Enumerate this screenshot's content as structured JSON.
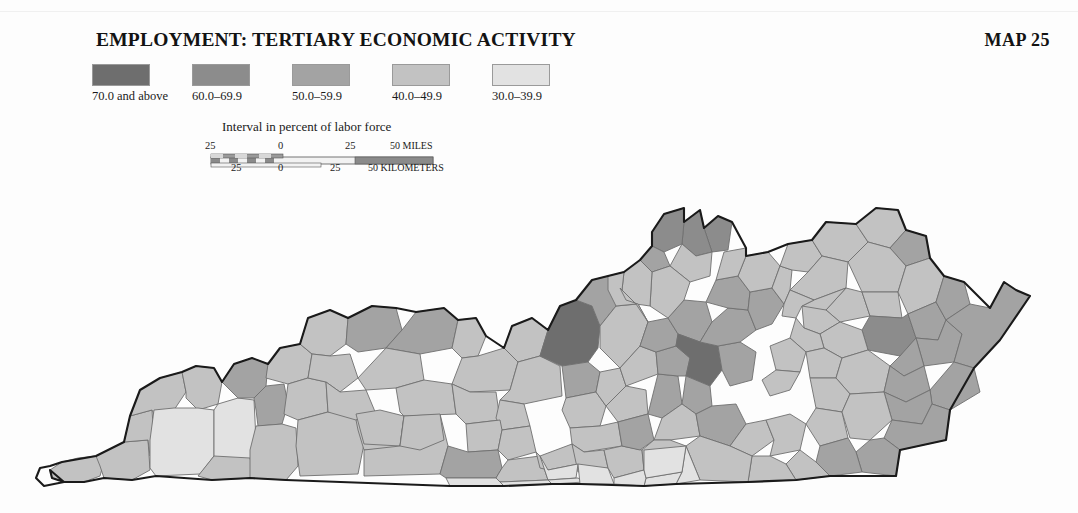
{
  "page": {
    "background": "#fdfdfd",
    "width": 1078,
    "height": 513
  },
  "header": {
    "title": "EMPLOYMENT: TERTIARY ECONOMIC ACTIVITY",
    "map_number": "MAP 25"
  },
  "legend": {
    "caption": "Interval in percent of labor force",
    "items": [
      {
        "label": "70.0 and above",
        "color": "#6e6e6e",
        "x": 18
      },
      {
        "label": "60.0–69.9",
        "color": "#8c8c8c",
        "x": 118
      },
      {
        "label": "50.0–59.9",
        "color": "#a3a3a3",
        "x": 218
      },
      {
        "label": "40.0–49.9",
        "color": "#c2c2c2",
        "x": 318
      },
      {
        "label": "30.0–39.9",
        "color": "#e2e2e2",
        "x": 418
      }
    ]
  },
  "scalebar": {
    "miles_unit": "50 MILES",
    "kilometers_unit": "50 KILOMETERS",
    "miles_ticks": [
      "25",
      "0",
      "25"
    ],
    "kilometers_ticks": [
      "25",
      "0",
      "25"
    ],
    "dark_color": "#8a8a8a",
    "light_color": "#f2f2f2",
    "border_color": "#555555"
  },
  "map": {
    "name": "kentucky-counties-choropleth",
    "outline_color": "#1a1a1a",
    "county_border_color": "#6f6f6f",
    "classes": {
      "c1": "#6e6e6e",
      "c2": "#8c8c8c",
      "c3": "#a3a3a3",
      "c4": "#c2c2c2",
      "c5": "#e2e2e2"
    },
    "counties": [
      {
        "id": "fulton",
        "class": "c4",
        "points": "50,470 62,462 78,458 96,456 104,462 100,476 84,482 64,482 52,478"
      },
      {
        "id": "hickman",
        "class": "c4",
        "points": "96,456 124,442 148,440 150,470 132,480 104,478 100,466"
      },
      {
        "id": "carlisle",
        "class": "c4",
        "points": "124,442 130,416 152,410 154,440 150,456 148,440"
      },
      {
        "id": "ballard",
        "class": "c4",
        "points": "130,416 140,390 160,378 182,372 186,392 174,410 154,414 152,410"
      },
      {
        "id": "mccracken",
        "class": "c4",
        "points": "182,372 196,366 214,368 222,382 218,404 198,410 186,398 186,392"
      },
      {
        "id": "graves",
        "class": "c5",
        "points": "150,440 154,410 174,408 198,408 214,410 214,456 200,474 156,476 150,468"
      },
      {
        "id": "marshall",
        "class": "c5",
        "points": "214,410 218,404 238,398 254,400 256,440 250,462 214,460"
      },
      {
        "id": "calloway",
        "class": "c4",
        "points": "214,456 250,458 254,478 212,480 198,476"
      },
      {
        "id": "livingston",
        "class": "c3",
        "points": "222,382 234,364 252,358 268,364 266,386 254,398 238,398"
      },
      {
        "id": "lyon",
        "class": "c3",
        "points": "254,398 266,386 284,384 288,404 282,424 258,426 256,410"
      },
      {
        "id": "trigg",
        "class": "c4",
        "points": "256,426 282,424 296,428 298,466 286,480 250,478 250,450"
      },
      {
        "id": "crittenden",
        "class": "c4",
        "points": "268,364 280,348 300,344 312,354 308,378 288,384 266,378"
      },
      {
        "id": "caldwell",
        "class": "c4",
        "points": "288,384 308,378 326,382 328,412 298,420 284,414"
      },
      {
        "id": "christian",
        "class": "c4",
        "points": "298,420 328,412 356,414 364,444 358,474 300,476 296,446"
      },
      {
        "id": "union",
        "class": "c4",
        "points": "300,344 308,318 330,310 348,318 346,344 330,356 312,354"
      },
      {
        "id": "webster",
        "class": "c4",
        "points": "312,354 330,356 350,354 358,378 340,392 326,382 308,378"
      },
      {
        "id": "hopkins",
        "class": "c4",
        "points": "326,382 340,392 366,390 376,414 356,420 328,412"
      },
      {
        "id": "muhlenberg",
        "class": "c4",
        "points": "356,420 376,414 396,418 400,448 364,450 358,430"
      },
      {
        "id": "todd",
        "class": "c4",
        "points": "356,414 364,444 400,446 404,416 380,410"
      },
      {
        "id": "logan",
        "class": "c4",
        "points": "400,446 404,416 440,414 448,446 440,474 364,476 364,450"
      },
      {
        "id": "henderson",
        "class": "c3",
        "points": "348,318 372,306 396,308 402,330 386,348 358,352 346,344"
      },
      {
        "id": "daviess",
        "class": "c3",
        "points": "402,330 416,312 444,308 458,320 452,348 420,354 386,348"
      },
      {
        "id": "mclean",
        "class": "c4",
        "points": "386,348 420,354 424,380 396,388 366,390 358,378"
      },
      {
        "id": "ohio",
        "class": "c4",
        "points": "396,388 424,380 452,384 456,414 404,416 400,412"
      },
      {
        "id": "butler",
        "class": "c4",
        "points": "400,446 404,416 440,414 444,440 420,450"
      },
      {
        "id": "hancock",
        "class": "c4",
        "points": "452,348 458,320 476,318 486,336 478,356 462,358"
      },
      {
        "id": "breckinridge",
        "class": "c4",
        "points": "462,358 478,356 504,348 518,362 510,390 470,392 452,384"
      },
      {
        "id": "grayson",
        "class": "c4",
        "points": "456,414 452,384 470,392 496,392 500,420 466,424"
      },
      {
        "id": "meade",
        "class": "c4",
        "points": "504,348 512,326 532,318 548,330 540,356 518,362"
      },
      {
        "id": "hardin",
        "class": "c4",
        "points": "510,390 518,362 540,356 560,366 562,396 524,404 500,400"
      },
      {
        "id": "larue",
        "class": "c4",
        "points": "500,400 524,404 530,426 502,430 496,418"
      },
      {
        "id": "edmonson",
        "class": "c4",
        "points": "466,424 500,420 502,430 498,450 468,452"
      },
      {
        "id": "warren",
        "class": "c3",
        "points": "440,474 448,446 468,452 498,450 502,468 496,478 446,478"
      },
      {
        "id": "hart",
        "class": "c4",
        "points": "498,450 502,430 530,426 536,452 508,460"
      },
      {
        "id": "barren",
        "class": "c4",
        "points": "496,478 502,468 508,460 540,456 548,480 500,482"
      },
      {
        "id": "jefferson",
        "class": "c1",
        "points": "548,330 560,306 576,300 592,306 600,326 598,348 588,362 562,366 540,356"
      },
      {
        "id": "oldham",
        "class": "c3",
        "points": "576,300 592,280 608,276 620,288 616,306 600,326 592,306"
      },
      {
        "id": "bullitt",
        "class": "c3",
        "points": "562,366 588,362 600,372 596,392 566,398"
      },
      {
        "id": "nelson",
        "class": "c4",
        "points": "566,398 596,392 606,406 600,426 570,428 562,410"
      },
      {
        "id": "spencer",
        "class": "c4",
        "points": "596,392 600,372 620,368 626,386 606,406"
      },
      {
        "id": "shelby",
        "class": "c4",
        "points": "600,326 616,306 638,304 648,322 640,346 620,368 600,348"
      },
      {
        "id": "anderson",
        "class": "c4",
        "points": "620,368 640,346 656,352 658,374 626,386"
      },
      {
        "id": "washington",
        "class": "c4",
        "points": "606,406 626,386 646,390 648,414 618,422"
      },
      {
        "id": "marion",
        "class": "c4",
        "points": "570,428 600,426 618,422 622,446 584,452 572,444"
      },
      {
        "id": "green",
        "class": "c4",
        "points": "536,452 540,456 572,444 578,464 548,470 540,468"
      },
      {
        "id": "taylor",
        "class": "c4",
        "points": "572,444 584,452 604,450 608,468 578,472"
      },
      {
        "id": "metcalfe",
        "class": "c5",
        "points": "540,456 548,480 576,478 578,464 548,470"
      },
      {
        "id": "monroe",
        "class": "c5",
        "points": "548,480 578,478 584,482 552,484"
      },
      {
        "id": "adair",
        "class": "c5",
        "points": "578,464 608,468 614,484 580,484"
      },
      {
        "id": "casey",
        "class": "c4",
        "points": "608,468 604,450 622,446 642,450 644,470 614,478"
      },
      {
        "id": "boyle",
        "class": "c3",
        "points": "622,446 618,422 648,414 654,440 640,450"
      },
      {
        "id": "mercer",
        "class": "c3",
        "points": "648,414 658,374 678,376 682,404 662,418"
      },
      {
        "id": "woodford",
        "class": "c3",
        "points": "658,374 656,352 676,346 690,358 686,376 678,376"
      },
      {
        "id": "franklin",
        "class": "c3",
        "points": "640,346 648,322 668,318 678,334 676,346 656,352"
      },
      {
        "id": "scott",
        "class": "c3",
        "points": "668,318 684,300 706,302 712,322 700,342 678,334"
      },
      {
        "id": "fayette",
        "class": "c1",
        "points": "690,358 676,346 678,334 700,342 718,346 722,370 710,386 686,376"
      },
      {
        "id": "jessamine",
        "class": "c3",
        "points": "682,404 686,376 710,386 712,406 696,414"
      },
      {
        "id": "garrard",
        "class": "c4",
        "points": "662,418 682,404 696,414 700,436 670,440 654,440"
      },
      {
        "id": "lincoln",
        "class": "c4",
        "points": "644,470 642,450 654,440 670,440 686,446 682,472"
      },
      {
        "id": "madison",
        "class": "c3",
        "points": "700,436 696,414 712,406 736,404 746,424 730,446"
      },
      {
        "id": "clark",
        "class": "c3",
        "points": "722,370 718,346 740,342 756,352 752,380 730,386"
      },
      {
        "id": "bourbon",
        "class": "c3",
        "points": "712,322 728,308 748,310 756,330 740,342 718,346 700,342"
      },
      {
        "id": "harrison",
        "class": "c3",
        "points": "706,302 716,280 738,276 750,292 748,310 728,308"
      },
      {
        "id": "nicholas",
        "class": "c3",
        "points": "748,310 750,292 772,288 784,304 772,324 756,330"
      },
      {
        "id": "bracken",
        "class": "c4",
        "points": "738,276 746,256 768,252 780,266 772,288 750,292"
      },
      {
        "id": "pendleton",
        "class": "c4",
        "points": "716,280 724,252 746,248 746,256 738,276"
      },
      {
        "id": "campbell",
        "class": "c2",
        "points": "704,228 718,216 732,222 728,250 712,252"
      },
      {
        "id": "kenton",
        "class": "c2",
        "points": "684,222 700,210 704,228 712,252 696,256 682,244"
      },
      {
        "id": "boone",
        "class": "c2",
        "points": "652,232 664,214 684,208 684,222 682,244 664,252 652,246"
      },
      {
        "id": "gallatin",
        "class": "c3",
        "points": "640,260 652,246 664,252 670,266 652,272"
      },
      {
        "id": "grant",
        "class": "c4",
        "points": "670,266 682,244 696,256 712,252 710,276 690,282"
      },
      {
        "id": "owen",
        "class": "c4",
        "points": "652,272 670,266 690,282 684,300 668,318 650,306"
      },
      {
        "id": "carroll",
        "class": "c4",
        "points": "624,272 640,260 652,272 650,306 636,304 622,290"
      },
      {
        "id": "trimble",
        "class": "c4",
        "points": "608,276 624,272 622,290 636,304 616,306 608,290"
      },
      {
        "id": "henry",
        "class": "c4",
        "points": "620,288 636,304 648,322 638,304 626,300"
      },
      {
        "id": "robertson",
        "class": "c4",
        "points": "772,288 780,266 792,270 790,290 784,304"
      },
      {
        "id": "mason",
        "class": "c4",
        "points": "780,266 788,244 812,240 822,256 808,272 792,270"
      },
      {
        "id": "lewis",
        "class": "c4",
        "points": "812,240 826,222 856,224 868,242 848,262 822,256"
      },
      {
        "id": "greenup",
        "class": "c4",
        "points": "856,224 876,208 898,210 906,230 890,248 868,242"
      },
      {
        "id": "boyd",
        "class": "c3",
        "points": "890,248 906,230 926,236 930,258 906,266"
      },
      {
        "id": "carter",
        "class": "c4",
        "points": "848,262 868,242 890,248 906,266 898,292 862,292"
      },
      {
        "id": "fleming",
        "class": "c4",
        "points": "790,290 808,272 822,256 848,262 846,288 814,300"
      },
      {
        "id": "rowan",
        "class": "c4",
        "points": "846,288 862,292 870,316 840,322 826,310"
      },
      {
        "id": "elliott",
        "class": "c4",
        "points": "862,292 898,292 902,318 870,316"
      },
      {
        "id": "lawrence",
        "class": "c4",
        "points": "898,292 906,266 930,258 944,276 936,302 908,314"
      },
      {
        "id": "bath",
        "class": "c4",
        "points": "814,300 846,288 826,310 810,318 802,306"
      },
      {
        "id": "montgomery",
        "class": "c4",
        "points": "784,304 790,290 814,300 802,306 796,318 782,316"
      },
      {
        "id": "menifee",
        "class": "c4",
        "points": "802,306 826,310 840,322 820,334 804,328"
      },
      {
        "id": "morgan",
        "class": "c2",
        "points": "870,316 902,318 908,314 916,338 900,356 868,350 862,330"
      },
      {
        "id": "johnson",
        "class": "c3",
        "points": "908,314 936,302 946,320 938,340 916,338"
      },
      {
        "id": "martin",
        "class": "c3",
        "points": "936,302 944,276 964,282 970,304 946,320"
      },
      {
        "id": "floyd",
        "class": "c3",
        "points": "916,338 938,340 946,320 962,334 954,362 924,366"
      },
      {
        "id": "pike",
        "class": "c3",
        "points": "946,320 970,304 990,308 1004,282 1016,290 1030,296 1000,340 974,368 954,362 962,334"
      },
      {
        "id": "magoffin",
        "class": "c3",
        "points": "900,356 916,338 924,366 904,376 890,366"
      },
      {
        "id": "wolfe",
        "class": "c4",
        "points": "820,334 840,322 862,330 868,350 842,358 824,348"
      },
      {
        "id": "powell",
        "class": "c4",
        "points": "796,318 804,328 820,334 824,348 806,352 790,338"
      },
      {
        "id": "estill",
        "class": "c4",
        "points": "770,346 790,338 806,352 800,372 776,370"
      },
      {
        "id": "lee",
        "class": "c4",
        "points": "806,352 824,348 842,358 836,378 810,378"
      },
      {
        "id": "breathitt",
        "class": "c4",
        "points": "842,358 868,350 890,366 884,392 850,394 836,378"
      },
      {
        "id": "knott",
        "class": "c3",
        "points": "884,392 890,366 904,376 924,366 930,390 906,402"
      },
      {
        "id": "letcher",
        "class": "c3",
        "points": "930,390 954,362 974,368 980,392 950,410 932,404"
      },
      {
        "id": "perry",
        "class": "c3",
        "points": "884,392 906,402 930,390 932,404 922,424 892,420"
      },
      {
        "id": "owsley",
        "class": "c4",
        "points": "810,378 836,378 850,394 842,412 816,408"
      },
      {
        "id": "jackson",
        "class": "c4",
        "points": "770,396 790,390 800,372 776,370 762,380"
      },
      {
        "id": "rockcastle",
        "class": "c4",
        "points": "730,446 746,424 766,420 774,440 752,456"
      },
      {
        "id": "laurel",
        "class": "c4",
        "points": "774,440 766,420 790,414 806,424 800,450 770,456"
      },
      {
        "id": "clay",
        "class": "c4",
        "points": "816,408 842,412 848,438 820,446 806,424"
      },
      {
        "id": "leslie",
        "class": "c4",
        "points": "842,412 850,394 884,392 892,420 870,440 850,438"
      },
      {
        "id": "harlan",
        "class": "c3",
        "points": "892,420 922,424 932,404 950,410 946,440 900,450 884,438"
      },
      {
        "id": "bell",
        "class": "c3",
        "points": "870,440 884,438 900,450 896,476 862,472 856,452"
      },
      {
        "id": "knox",
        "class": "c3",
        "points": "820,446 848,438 856,452 862,472 830,476 816,462"
      },
      {
        "id": "whitley",
        "class": "c4",
        "points": "800,450 816,462 830,476 796,480 786,464"
      },
      {
        "id": "mccreary",
        "class": "c4",
        "points": "752,456 770,456 786,464 796,480 748,482"
      },
      {
        "id": "pulaski",
        "class": "c4",
        "points": "686,446 700,436 730,446 752,456 748,482 700,480"
      },
      {
        "id": "wayne",
        "class": "c5",
        "points": "682,472 686,446 700,480 676,484"
      },
      {
        "id": "clinton",
        "class": "c5",
        "points": "646,478 682,472 676,484 644,486"
      },
      {
        "id": "cumberland",
        "class": "c5",
        "points": "614,484 644,486 646,478 644,470 614,478"
      },
      {
        "id": "russell",
        "class": "c5",
        "points": "644,470 646,478 682,472 686,446 644,450"
      },
      {
        "id": "allen",
        "class": "c5",
        "points": "500,482 548,480 552,484 504,486"
      },
      {
        "id": "simpson",
        "class": "c5",
        "points": "446,478 496,478 500,482 504,486 450,486"
      }
    ],
    "outline": "M 50,470 L 52,478 L 64,482 L 44,486 L 36,478 L 40,468 L 50,466 L 62,462 L 96,456 L 124,442 L 130,416 L 140,390 L 160,378 L 182,372 L 196,366 L 214,368 L 222,382 L 234,364 L 252,358 L 268,364 L 280,348 L 300,344 L 308,318 L 330,310 L 348,318 L 372,306 L 396,308 L 416,312 L 444,308 L 458,320 L 476,318 L 486,336 L 504,348 L 512,326 L 532,318 L 548,330 L 560,306 L 576,300 L 592,280 L 608,276 L 624,272 L 640,260 L 652,246 L 652,232 L 664,214 L 684,208 L 684,222 L 700,210 L 704,228 L 718,216 L 732,222 L 746,248 L 746,256 L 768,252 L 788,244 L 812,240 L 826,222 L 856,224 L 876,208 L 898,210 L 906,230 L 926,236 L 930,258 L 944,276 L 964,282 L 990,308 L 1004,282 L 1016,290 L 1030,296 L 1000,340 L 974,368 L 950,410 L 946,440 L 900,450 L 896,476 L 830,476 L 796,480 L 748,482 L 676,484 L 644,486 L 580,484 L 552,484 L 504,486 L 450,486 L 286,480 L 250,478 L 212,480 L 156,476 L 132,480 L 104,478 L 84,482 L 64,482 Z"
  }
}
